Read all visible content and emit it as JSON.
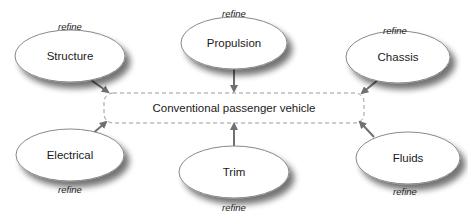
{
  "diagram": {
    "center": {
      "label": "Conventional passenger vehicle",
      "x": 104,
      "y": 93,
      "w": 260,
      "h": 30
    },
    "relation_label": "refine",
    "colors": {
      "stroke": "#888888",
      "arrow": "#707070",
      "shadow": "#9a9a9a",
      "fill": "#ffffff",
      "dash": "#999999"
    },
    "nodes": [
      {
        "id": "structure",
        "label": "Structure",
        "cx": 70,
        "cy": 56,
        "rx": 55,
        "ry": 26,
        "rel_x": 70,
        "rel_y": 27,
        "from": [
          88,
          78
        ],
        "to": [
          108,
          92
        ]
      },
      {
        "id": "propulsion",
        "label": "Propulsion",
        "cx": 234,
        "cy": 43,
        "rx": 53,
        "ry": 26,
        "rel_x": 234,
        "rel_y": 14,
        "from": [
          234,
          69
        ],
        "to": [
          234,
          91
        ]
      },
      {
        "id": "chassis",
        "label": "Chassis",
        "cx": 398,
        "cy": 57,
        "rx": 52,
        "ry": 26,
        "rel_x": 395,
        "rel_y": 31,
        "from": [
          378,
          80
        ],
        "to": [
          362,
          93
        ]
      },
      {
        "id": "electrical",
        "label": "Electrical",
        "cx": 70,
        "cy": 155,
        "rx": 54,
        "ry": 26,
        "rel_x": 70,
        "rel_y": 190,
        "from": [
          90,
          136
        ],
        "to": [
          106,
          122
        ]
      },
      {
        "id": "trim",
        "label": "Trim",
        "cx": 234,
        "cy": 172,
        "rx": 55,
        "ry": 26,
        "rel_x": 234,
        "rel_y": 208,
        "from": [
          234,
          152
        ],
        "to": [
          234,
          124
        ]
      },
      {
        "id": "fluids",
        "label": "Fluids",
        "cx": 408,
        "cy": 158,
        "rx": 52,
        "ry": 26,
        "rel_x": 405,
        "rel_y": 192,
        "from": [
          374,
          137
        ],
        "to": [
          360,
          122
        ]
      }
    ]
  }
}
